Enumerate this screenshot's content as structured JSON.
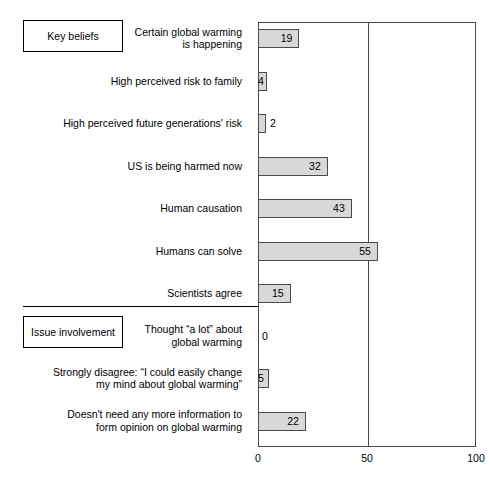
{
  "chart_data": {
    "type": "bar",
    "orientation": "horizontal",
    "title": "",
    "xlabel": "",
    "ylabel": "",
    "xlim": [
      0,
      100
    ],
    "ticks": [
      "0",
      "50",
      "100"
    ],
    "tick_values": [
      0,
      50,
      100
    ],
    "grid": "vertical gridline at 50",
    "legend": "none",
    "categories": [
      "Certain global warming\nis happening",
      "High perceived risk to family",
      "High perceived future generations' risk",
      "US is being harmed now",
      "Human causation",
      "Humans can solve",
      "Scientists agree",
      "Thought “a lot” about\nglobal warming",
      "Strongly disagree: “I could easily change\nmy mind about global warming”",
      "Doesn't need any more information to\nform opinion on global warming"
    ],
    "values": [
      19,
      4,
      2,
      32,
      43,
      55,
      15,
      0,
      5,
      22
    ],
    "groups": [
      {
        "label": "Key beliefs",
        "indices": [
          0,
          1,
          2,
          3,
          4,
          5,
          6
        ]
      },
      {
        "label": "Issue involvement",
        "indices": [
          7,
          8,
          9
        ]
      }
    ],
    "bar_fill": "#d8d8d8",
    "bar_stroke": "#4a4a4a"
  },
  "rows": [
    {
      "label": "Certain global warming\nis happening",
      "value": 19,
      "value_text": "19",
      "inside": true
    },
    {
      "label": "High perceived risk to family",
      "value": 4,
      "value_text": "4",
      "inside": true
    },
    {
      "label": "High perceived future generations' risk",
      "value": 2,
      "value_text": "2",
      "inside": false
    },
    {
      "label": "US is being harmed now",
      "value": 32,
      "value_text": "32",
      "inside": true
    },
    {
      "label": "Human causation",
      "value": 43,
      "value_text": "43",
      "inside": true
    },
    {
      "label": "Humans can solve",
      "value": 55,
      "value_text": "55",
      "inside": true
    },
    {
      "label": "Scientists agree",
      "value": 15,
      "value_text": "15",
      "inside": true
    },
    {
      "label": "Thought “a lot” about\nglobal warming",
      "value": 0,
      "value_text": "0",
      "inside": false
    },
    {
      "label": "Strongly disagree: “I could easily change\nmy mind about global warming”",
      "value": 5,
      "value_text": "5",
      "inside": true
    },
    {
      "label": "Doesn't need any more information to\nform opinion on global warming",
      "value": 22,
      "value_text": "22",
      "inside": true
    }
  ],
  "groups": {
    "key_beliefs": "Key beliefs",
    "issue_involvement": "Issue involvement"
  },
  "axis": {
    "tick_0": "0",
    "tick_50": "50",
    "tick_100": "100"
  },
  "caption": ""
}
